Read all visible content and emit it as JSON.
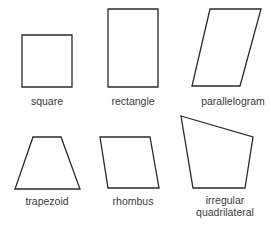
{
  "diagram": {
    "title": "",
    "shapes": [
      {
        "name": "square",
        "label": "square",
        "points": "22,35 72,35 72,87 22,87",
        "label_x": 47,
        "label_y": 95
      },
      {
        "name": "rectangle",
        "label": "rectangle",
        "points": "108,9 158,9 158,87 108,87",
        "label_x": 133,
        "label_y": 95
      },
      {
        "name": "parallelogram",
        "label": "parallelogram",
        "points": "210,9 261,9 240,86 192,86",
        "label_x": 233,
        "label_y": 95
      },
      {
        "name": "trapezoid",
        "label": "trapezoid",
        "points": "33,137 61,137 80,189 15,189",
        "label_x": 47,
        "label_y": 195
      },
      {
        "name": "rhombus",
        "label": "rhombus",
        "points": "100,137 150,137 159,188 108,188",
        "label_x": 133,
        "label_y": 195
      },
      {
        "name": "irregular-quadrilateral",
        "label_line1": "irregular",
        "label_line2": "quadrilateral",
        "points": "181,116 253,137 245,188 193,188",
        "label_x": 225,
        "label_y": 194
      }
    ],
    "stroke_color": "#2a2a2a",
    "label_color": "#3a3a3a"
  }
}
